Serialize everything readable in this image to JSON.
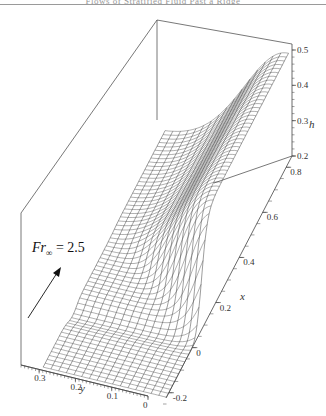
{
  "header": {
    "running_title": "Flows of Stratified Fluid Past a Ridge"
  },
  "chart_data": {
    "type": "surface",
    "title": "",
    "annotation": {
      "label_main": "Fr",
      "label_sub": "∞",
      "label_rest": " = 2.5",
      "arrow": "flow-direction"
    },
    "axes": {
      "h": {
        "label": "h",
        "ticks": [
          "0.2",
          "0.3",
          "0.4",
          "0.5"
        ],
        "range": [
          0.2,
          0.52
        ]
      },
      "x": {
        "label": "x",
        "ticks": [
          "-0.2",
          "0",
          "0.2",
          "0.4",
          "0.6",
          "0.8"
        ],
        "range": [
          -0.25,
          0.85
        ]
      },
      "y": {
        "label": "y",
        "ticks": [
          "0",
          "0.1",
          "0.2",
          "0.3"
        ],
        "range": [
          0,
          0.35
        ]
      }
    },
    "surface": {
      "description": "Wireframe of free-surface height h(x,y): flat ~0.2 upstream (x<0), steep rise near x≈0–0.2 close to y≈0, plateau ~0.5 downstream near y≈0.05–0.15, decaying toward larger y",
      "h_upstream": 0.2,
      "h_plateau": 0.5,
      "grid_lines_x": 60,
      "grid_lines_y": 16
    },
    "grid": false,
    "legend": null
  },
  "colors": {
    "mesh": "#3a3a3a",
    "frame": "#555555",
    "axis": "#444444"
  }
}
